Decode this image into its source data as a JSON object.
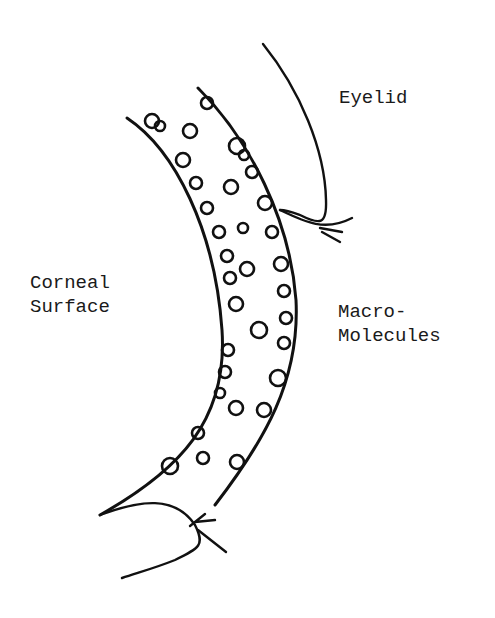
{
  "diagram": {
    "type": "schematic drawing",
    "labels": {
      "eyelid": "Eyelid",
      "corneal_surface_line1": "Corneal",
      "corneal_surface_line2": "Surface",
      "macromolecules_line1": "Macro-",
      "macromolecules_line2": "Molecules"
    },
    "elements": [
      {
        "name": "tear-film-layer",
        "shape": "curved band filled with macromolecule clusters"
      },
      {
        "name": "upper-eyelid-arrow",
        "points_to": "outer edge of tear film"
      },
      {
        "name": "lower-eyelid-arrow",
        "points_to": "inner edge of tear film"
      }
    ],
    "colors": {
      "ink": "#111111",
      "background": "#ffffff"
    }
  }
}
